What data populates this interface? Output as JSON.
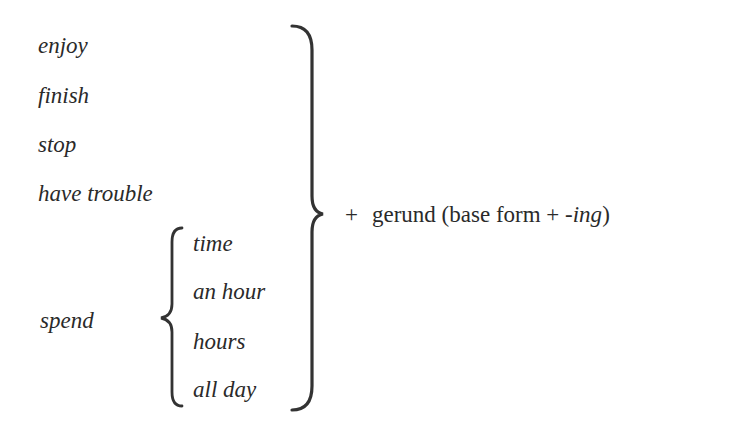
{
  "verbs": [
    {
      "label": "enjoy"
    },
    {
      "label": "finish"
    },
    {
      "label": "stop"
    },
    {
      "label": "have trouble"
    }
  ],
  "spend": {
    "label": "spend",
    "objects": [
      "time",
      "an hour",
      "hours",
      "all day"
    ]
  },
  "result": {
    "plus": "+",
    "gerund": "gerund (base form +",
    "suffix": "-ing",
    "close": ")"
  },
  "colors": {
    "text": "#2a2a2a",
    "brace": "#333333",
    "background": "#ffffff"
  }
}
